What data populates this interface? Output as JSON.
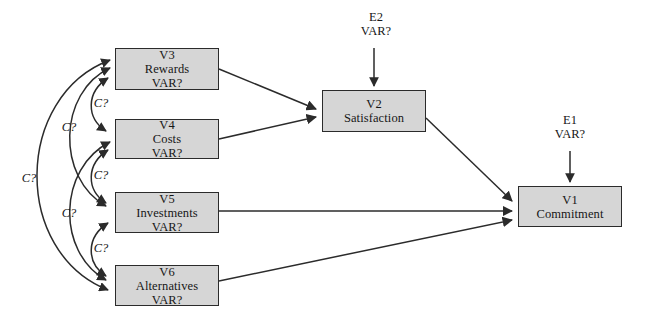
{
  "diagram": {
    "type": "sem-path-diagram",
    "canvas": {
      "width": 647,
      "height": 315
    },
    "style": {
      "box_fill": "#d6d6d6",
      "box_stroke": "#2b2b2b",
      "edge_color": "#2b2b2b",
      "background": "#ffffff"
    },
    "nodes": [
      {
        "id": "V3",
        "name": "rewards",
        "line1": "V3",
        "line2": "Rewards",
        "line3": "VAR?",
        "x": 115,
        "y": 48,
        "w": 104,
        "h": 42
      },
      {
        "id": "V4",
        "name": "costs",
        "line1": "V4",
        "line2": "Costs",
        "line3": "VAR?",
        "x": 115,
        "y": 119,
        "w": 104,
        "h": 40
      },
      {
        "id": "V5",
        "name": "investments",
        "line1": "V5",
        "line2": "Investments",
        "line3": "VAR?",
        "x": 115,
        "y": 192,
        "w": 104,
        "h": 41
      },
      {
        "id": "V6",
        "name": "alternatives",
        "line1": "V6",
        "line2": "Alternatives",
        "line3": "VAR?",
        "x": 115,
        "y": 265,
        "w": 104,
        "h": 41
      },
      {
        "id": "V2",
        "name": "satisfaction",
        "line1": "V2",
        "line2": "Satisfaction",
        "line3": "",
        "x": 322,
        "y": 90,
        "w": 104,
        "h": 42
      },
      {
        "id": "V1",
        "name": "commitment",
        "line1": "V1",
        "line2": "Commitment",
        "line3": "",
        "x": 518,
        "y": 186,
        "w": 104,
        "h": 41
      }
    ],
    "residuals": [
      {
        "id": "E2",
        "name": "satisfaction-disturbance",
        "line1": "E2",
        "line2": "VAR?",
        "x": 348,
        "y": 10,
        "w": 56,
        "arrow": {
          "x": 374,
          "y1": 48,
          "y2": 88
        }
      },
      {
        "id": "E1",
        "name": "commitment-disturbance",
        "line1": "E1",
        "line2": "VAR?",
        "x": 542,
        "y": 113,
        "w": 56,
        "arrow": {
          "x": 570,
          "y1": 150,
          "y2": 184
        }
      }
    ],
    "correlations": [
      {
        "id": "c-v3-v4",
        "label": "C?",
        "lx": 98,
        "ly": 96,
        "between": "V3-V4"
      },
      {
        "id": "c-v4-v5",
        "label": "C?",
        "lx": 98,
        "ly": 168,
        "between": "V4-V5"
      },
      {
        "id": "c-v5-v6",
        "label": "C?",
        "lx": 98,
        "ly": 241,
        "between": "V5-V6"
      },
      {
        "id": "c-v3-v5",
        "label": "C?",
        "lx": 66,
        "ly": 127,
        "between": "V3-V5"
      },
      {
        "id": "c-v4-v6",
        "label": "C?",
        "lx": 66,
        "ly": 213,
        "between": "V4-V6"
      },
      {
        "id": "c-v3-v6",
        "label": "C?",
        "lx": 25,
        "ly": 178,
        "between": "V3-V6"
      }
    ],
    "paths": [
      {
        "id": "p-v3-v2",
        "from": "V3",
        "to": "V2",
        "label": ""
      },
      {
        "id": "p-v4-v2",
        "from": "V4",
        "to": "V2",
        "label": ""
      },
      {
        "id": "p-v2-v1",
        "from": "V2",
        "to": "V1",
        "label": ""
      },
      {
        "id": "p-v5-v1",
        "from": "V5",
        "to": "V1",
        "label": ""
      },
      {
        "id": "p-v6-v1",
        "from": "V6",
        "to": "V1",
        "label": ""
      }
    ]
  }
}
